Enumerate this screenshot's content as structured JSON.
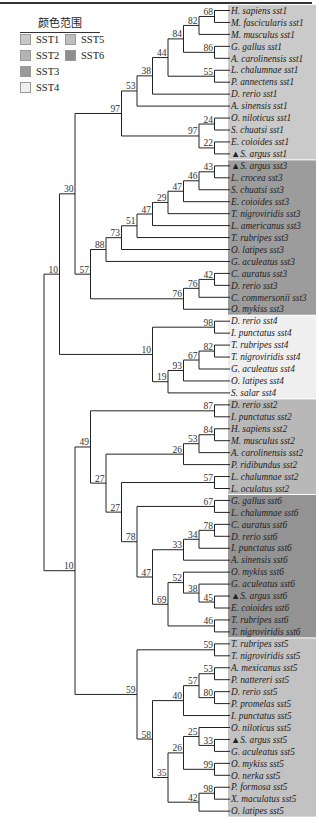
{
  "legend": {
    "title": "颜色范围",
    "items": [
      {
        "label": "SST1",
        "color": "#c8c8c8"
      },
      {
        "label": "SST2",
        "color": "#b4b4b4"
      },
      {
        "label": "SST3",
        "color": "#9a9a9a"
      },
      {
        "label": "SST4",
        "color": "#efefef"
      },
      {
        "label": "SST5",
        "color": "#bebebe"
      },
      {
        "label": "SST6",
        "color": "#8e8e8e"
      }
    ]
  },
  "groups": [
    {
      "name": "SST1",
      "color": "#cacaca",
      "first": 0,
      "last": 12
    },
    {
      "name": "SST3",
      "color": "#9c9c9c",
      "first": 13,
      "last": 25
    },
    {
      "name": "SST4",
      "color": "#efefef",
      "first": 26,
      "last": 32
    },
    {
      "name": "SST2",
      "color": "#b8b8b8",
      "first": 33,
      "last": 40
    },
    {
      "name": "SST6",
      "color": "#939393",
      "first": 41,
      "last": 52
    },
    {
      "name": "SST5",
      "color": "#c2c2c2",
      "first": 53,
      "last": 67
    }
  ],
  "leaves": [
    "H. sapiens sst1",
    "M. fascicularis sst1",
    "M. musculus sst1",
    "G. gallus sst1",
    "A. carolinensis sst1",
    "L. chalumnae sst1",
    "P. annectens sst1",
    "D. rerio sst1",
    "A. sinensis sst1",
    "O. niloticus sst1",
    "S. chuatsi sst1",
    "E. coioides sst1",
    "▲S. argus sst1",
    "▲S. argus sst3",
    "L. crocea sst3",
    "S. chuatsi sst3",
    "E. coioides sst3",
    "T. nigroviridis sst3",
    "L. americanus sst3",
    "T. rubripes sst3",
    "O. latipes sst3",
    "G. aculeatus sst3",
    "C. auratus sst3",
    "D. rerio sst3",
    "C. commersonii sst3",
    "O. mykiss sst3",
    "D. rerio sst4",
    "I. punctatus sst4",
    "T. rubripes sst4",
    "T. nigroviridis sst4",
    "G. aculeatus sst4",
    "O. latipes sst4",
    "S. salar sst4",
    "D. rerio sst2",
    "I. punctatus sst2",
    "H. sapiens sst2",
    "M. musculus sst2",
    "A. carolinensis sst2",
    "P. ridibundus sst2",
    "L. chalumnae sst2",
    "L. oculatus sst2",
    "G. gallus sst6",
    "L. chalumnae sst6",
    "C. auratus sst6",
    "D. rerio sst6",
    "I. punctatus sst6",
    "A. sinensis sst6",
    "O. mykiss sst6",
    "G. aculeatus sst6",
    "▲S. argus sst6",
    "E. coioides sst6",
    "T. rubripes sst6",
    "T. nigroviridis sst6",
    "T. rubripes sst5",
    "T. nigroviridis sst5",
    "A. mexicanus sst5",
    "P. nattereri sst5",
    "D. rerio sst5",
    "P. promelas sst5",
    "I. punctatus sst5",
    "O. niloticus sst5",
    "▲S. argus sst5",
    "G. aculeatus sst5",
    "O. mykiss sst5",
    "O. nerka sst5",
    "P. formosa sst5",
    "X. maculatus sst5",
    "O. latipes sst5"
  ],
  "tree": {
    "b": null,
    "c": [
      {
        "b": 10,
        "c": [
          {
            "b": 30,
            "c": [
              {
                "b": 97,
                "c": [
                  {
                    "b": 53,
                    "c": [
                      {
                        "b": 38,
                        "c": [
                          {
                            "b": 44,
                            "c": [
                              {
                                "b": 84,
                                "c": [
                                  {
                                    "b": 82,
                                    "c": [
                                      {
                                        "b": 68,
                                        "c": [
                                          {
                                            "l": 0
                                          },
                                          {
                                            "l": 1
                                          }
                                        ]
                                      },
                                      {
                                        "l": 2
                                      }
                                    ]
                                  },
                                  {
                                    "b": 86,
                                    "c": [
                                      {
                                        "l": 3
                                      },
                                      {
                                        "l": 4
                                      }
                                    ]
                                  }
                                ]
                              },
                              {
                                "b": 55,
                                "c": [
                                  {
                                    "l": 5
                                  },
                                  {
                                    "l": 6
                                  }
                                ]
                              }
                            ]
                          },
                          {
                            "l": 7
                          }
                        ]
                      },
                      {
                        "l": 8
                      }
                    ]
                  },
                  {
                    "b": 97,
                    "c": [
                      {
                        "b": 24,
                        "c": [
                          {
                            "l": 9
                          },
                          {
                            "l": 10
                          }
                        ]
                      },
                      {
                        "b": 22,
                        "c": [
                          {
                            "l": 11
                          },
                          {
                            "l": 12
                          }
                        ]
                      }
                    ]
                  }
                ]
              },
              {
                "b": 57,
                "c": [
                  {
                    "b": 88,
                    "c": [
                      {
                        "b": 73,
                        "c": [
                          {
                            "b": 51,
                            "c": [
                              {
                                "b": 47,
                                "c": [
                                  {
                                    "b": 29,
                                    "c": [
                                      {
                                        "b": 47,
                                        "c": [
                                          {
                                            "b": 46,
                                            "c": [
                                              {
                                                "b": 43,
                                                "c": [
                                                  {
                                                    "l": 13
                                                  },
                                                  {
                                                    "l": 14
                                                  }
                                                ]
                                              },
                                              {
                                                "l": 15
                                              }
                                            ]
                                          },
                                          {
                                            "l": 16
                                          }
                                        ]
                                      },
                                      {
                                        "l": 17
                                      }
                                    ]
                                  },
                                  {
                                    "l": 18
                                  }
                                ]
                              },
                              {
                                "l": 19
                              }
                            ]
                          },
                          {
                            "l": 20
                          }
                        ]
                      },
                      {
                        "l": 21
                      }
                    ]
                  },
                  {
                    "b": 76,
                    "c": [
                      {
                        "b": 76,
                        "c": [
                          {
                            "b": 42,
                            "c": [
                              {
                                "l": 22
                              },
                              {
                                "l": 23
                              }
                            ]
                          },
                          {
                            "l": 24
                          }
                        ]
                      },
                      {
                        "l": 25
                      }
                    ]
                  }
                ]
              }
            ]
          },
          {
            "b": 10,
            "c": [
              {
                "b": 98,
                "c": [
                  {
                    "l": 26
                  },
                  {
                    "l": 27
                  }
                ]
              },
              {
                "b": 19,
                "c": [
                  {
                    "b": 93,
                    "c": [
                      {
                        "b": 67,
                        "c": [
                          {
                            "b": 82,
                            "c": [
                              {
                                "l": 28
                              },
                              {
                                "l": 29
                              }
                            ]
                          },
                          {
                            "l": 30
                          }
                        ]
                      },
                      {
                        "l": 31
                      }
                    ]
                  },
                  {
                    "l": 32
                  }
                ]
              }
            ]
          }
        ]
      },
      {
        "b": 10,
        "c": [
          {
            "b": 49,
            "c": [
              {
                "b": 87,
                "c": [
                  {
                    "l": 33
                  },
                  {
                    "l": 34
                  }
                ]
              },
              {
                "b": 27,
                "c": [
                  {
                    "b": 26,
                    "c": [
                      {
                        "b": 53,
                        "c": [
                          {
                            "b": 84,
                            "c": [
                              {
                                "l": 35
                              },
                              {
                                "l": 36
                              }
                            ]
                          },
                          {
                            "l": 37
                          }
                        ]
                      },
                      {
                        "l": 38
                      }
                    ]
                  },
                  {
                    "b": 27,
                    "c": [
                      {
                        "b": 57,
                        "c": [
                          {
                            "l": 39
                          },
                          {
                            "l": 40
                          }
                        ]
                      },
                      {
                        "b": 78,
                        "c": [
                          {
                            "b": 67,
                            "c": [
                              {
                                "l": 41
                              },
                              {
                                "l": 42
                              }
                            ]
                          },
                          {
                            "b": 47,
                            "c": [
                              {
                                "b": 33,
                                "c": [
                                  {
                                    "b": 34,
                                    "c": [
                                      {
                                        "b": 78,
                                        "c": [
                                          {
                                            "l": 43
                                          },
                                          {
                                            "l": 44
                                          }
                                        ]
                                      },
                                      {
                                        "l": 45
                                      }
                                    ]
                                  },
                                  {
                                    "l": 46
                                  }
                                ]
                              },
                              {
                                "b": 69,
                                "c": [
                                  {
                                    "b": 52,
                                    "c": [
                                      {
                                        "l": 47
                                      },
                                      {
                                        "b": 38,
                                        "c": [
                                          {
                                            "l": 48
                                          },
                                          {
                                            "b": 45,
                                            "c": [
                                              {
                                                "l": 49
                                              },
                                              {
                                                "l": 50
                                              }
                                            ]
                                          }
                                        ]
                                      }
                                    ]
                                  },
                                  {
                                    "b": 46,
                                    "c": [
                                      {
                                        "l": 51
                                      },
                                      {
                                        "l": 52
                                      }
                                    ]
                                  }
                                ]
                              }
                            ]
                          }
                        ]
                      }
                    ]
                  }
                ]
              }
            ]
          },
          {
            "b": 59,
            "c": [
              {
                "b": 59,
                "c": [
                  {
                    "l": 53
                  },
                  {
                    "l": 54
                  }
                ]
              },
              {
                "b": 58,
                "c": [
                  {
                    "b": 40,
                    "c": [
                      {
                        "b": 57,
                        "c": [
                          {
                            "b": 53,
                            "c": [
                              {
                                "l": 55
                              },
                              {
                                "l": 56
                              }
                            ]
                          },
                          {
                            "b": 80,
                            "c": [
                              {
                                "l": 57
                              },
                              {
                                "l": 58
                              }
                            ]
                          }
                        ]
                      },
                      {
                        "l": 59
                      }
                    ]
                  },
                  {
                    "b": 35,
                    "c": [
                      {
                        "b": 26,
                        "c": [
                          {
                            "b": 25,
                            "c": [
                              {
                                "l": 60
                              },
                              {
                                "b": 33,
                                "c": [
                                  {
                                    "l": 61
                                  },
                                  {
                                    "l": 62
                                  }
                                ]
                              }
                            ]
                          },
                          {
                            "b": 99,
                            "c": [
                              {
                                "l": 63
                              },
                              {
                                "l": 64
                              }
                            ]
                          }
                        ]
                      },
                      {
                        "b": 42,
                        "c": [
                          {
                            "b": 98,
                            "c": [
                              {
                                "l": 65
                              },
                              {
                                "l": 66
                              }
                            ]
                          },
                          {
                            "l": 67
                          }
                        ]
                      }
                    ]
                  }
                ]
              }
            ]
          }
        ]
      }
    ]
  }
}
